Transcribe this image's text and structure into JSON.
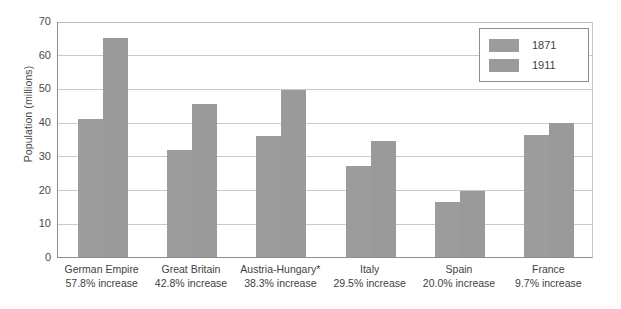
{
  "chart_data": {
    "type": "bar",
    "title": "",
    "subtitle": "",
    "xlabel": "",
    "ylabel": "Population (millions)",
    "ylim": [
      0,
      70
    ],
    "ytick_step": 10,
    "yticks": [
      "70",
      "60",
      "50",
      "40",
      "30",
      "20",
      "10",
      "0"
    ],
    "grid": true,
    "legend_position": "top-right",
    "categories": [
      "German Empire",
      "Great Britain",
      "Austria-Hungary*",
      "Italy",
      "Spain",
      "France"
    ],
    "category_sublabels": [
      "57.8% increase",
      "42.8% increase",
      "38.3% increase",
      "29.5% increase",
      "20.0% increase",
      "9.7% increase"
    ],
    "series": [
      {
        "name": "1871",
        "color": "#9c9c9c",
        "values": [
          41.0,
          31.8,
          36.0,
          27.0,
          16.3,
          36.3
        ]
      },
      {
        "name": "1911",
        "color": "#9a9a9a",
        "values": [
          64.9,
          45.4,
          49.6,
          34.5,
          19.6,
          39.8
        ]
      }
    ]
  },
  "legend": {
    "entries": [
      {
        "label": "1871"
      },
      {
        "label": "1911"
      }
    ]
  },
  "axis": {
    "y_title": "Population (millions)"
  },
  "colors": {
    "bar": "#9a9a9a",
    "gridline": "#c9c9c9",
    "axis": "#8e8e8e",
    "text": "#3f3f3f",
    "background": "#ffffff"
  }
}
